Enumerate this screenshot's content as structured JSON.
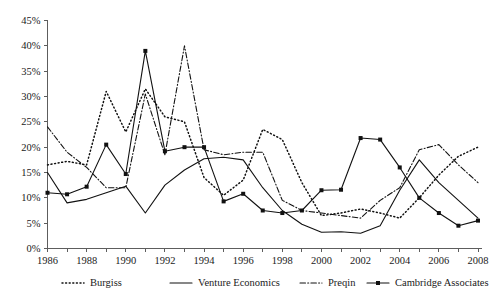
{
  "figure": {
    "title": "",
    "background_color": "#ffffff",
    "line_color": "#111111",
    "axis_color": "#5d5d5d"
  },
  "axes": {
    "y_ticks": [
      "0%",
      "5%",
      "10%",
      "15%",
      "20%",
      "25%",
      "30%",
      "35%",
      "40%",
      "45%"
    ],
    "x_ticks": [
      "1986",
      "1988",
      "1990",
      "1992",
      "1994",
      "1996",
      "1998",
      "2000",
      "2002",
      "2004",
      "2006",
      "2008"
    ]
  },
  "legend": {
    "position": "bottom",
    "items": [
      {
        "label": "Burgiss",
        "style": "dotted",
        "marker": "none"
      },
      {
        "label": "Venture Economics",
        "style": "solid",
        "marker": "none"
      },
      {
        "label": "Preqin",
        "style": "dash-dot",
        "marker": "none"
      },
      {
        "label": "Cambridge Associates",
        "style": "solid",
        "marker": "square"
      }
    ]
  },
  "chart_data": {
    "type": "line",
    "title": "",
    "xlabel": "",
    "ylabel": "",
    "xlim": [
      1986,
      2008
    ],
    "ylim": [
      0,
      45
    ],
    "y_unit": "percent",
    "grid": false,
    "legend_position": "bottom",
    "x": [
      1986,
      1987,
      1988,
      1989,
      1990,
      1991,
      1992,
      1993,
      1994,
      1995,
      1996,
      1997,
      1998,
      1999,
      2000,
      2001,
      2002,
      2003,
      2004,
      2005,
      2006,
      2007,
      2008
    ],
    "x_tick_labels": [
      "1986",
      "",
      "1988",
      "",
      "1990",
      "",
      "1992",
      "",
      "1994",
      "",
      "1996",
      "",
      "1998",
      "",
      "2000",
      "",
      "2002",
      "",
      "2004",
      "",
      "2006",
      "",
      "2008"
    ],
    "series": [
      {
        "name": "Burgiss",
        "style": "dotted",
        "marker": "none",
        "values": [
          16.5,
          17.2,
          16.5,
          31.0,
          23.0,
          31.5,
          26.0,
          25.0,
          14.0,
          10.5,
          13.5,
          23.5,
          21.5,
          13.0,
          6.5,
          7.0,
          7.8,
          7.0,
          6.0,
          10.0,
          14.5,
          18.2,
          20.0
        ]
      },
      {
        "name": "Venture Economics",
        "style": "solid",
        "marker": "none",
        "values": [
          15.0,
          9.0,
          9.7,
          11.0,
          12.3,
          7.0,
          12.5,
          15.5,
          17.7,
          18.0,
          17.5,
          12.0,
          7.5,
          4.8,
          3.2,
          3.3,
          3.0,
          4.5,
          11.5,
          17.5,
          13.0,
          9.5,
          6.0
        ]
      },
      {
        "name": "Preqin",
        "style": "dash-dot",
        "marker": "none",
        "values": [
          24.0,
          19.0,
          16.0,
          12.0,
          12.0,
          30.5,
          18.5,
          40.0,
          19.5,
          18.5,
          19.0,
          19.0,
          9.5,
          7.5,
          7.0,
          6.5,
          6.0,
          9.5,
          12.0,
          19.5,
          20.5,
          16.5,
          13.0
        ]
      },
      {
        "name": "Cambridge Associates",
        "style": "solid",
        "marker": "square",
        "values": [
          11.0,
          10.7,
          12.2,
          20.5,
          14.7,
          39.0,
          19.2,
          20.0,
          20.0,
          9.3,
          10.8,
          7.5,
          7.0,
          7.5,
          11.5,
          11.6,
          21.8,
          21.5,
          16.0,
          10.0,
          7.0,
          4.5,
          5.5
        ]
      }
    ],
    "series_points": [
      {
        "name": "Burgiss",
        "points": [
          {
            "x": 1986,
            "y": 16.5
          },
          {
            "x": 1987,
            "y": 17.2
          },
          {
            "x": 1988,
            "y": 16.5
          },
          {
            "x": 1989,
            "y": 14.0
          },
          {
            "x": 1990,
            "y": 19.0
          },
          {
            "x": 1991,
            "y": 31.2
          },
          {
            "x": 1992,
            "y": 30.0
          },
          {
            "x": 1993,
            "y": 25.0
          },
          {
            "x": 1994,
            "y": 11.5
          },
          {
            "x": 1995,
            "y": 12.0
          },
          {
            "x": 1996,
            "y": 15.0
          },
          {
            "x": 1997,
            "y": 24.5
          },
          {
            "x": 1998,
            "y": 18.5
          },
          {
            "x": 1999,
            "y": 11.5
          },
          {
            "x": 2000,
            "y": 8.3
          },
          {
            "x": 2001,
            "y": 6.5
          },
          {
            "x": 2002,
            "y": 6.7
          },
          {
            "x": 2003,
            "y": 8.4
          },
          {
            "x": 2004,
            "y": 9.0
          },
          {
            "x": 2005,
            "y": 11.0
          },
          {
            "x": 2006,
            "y": 13.5
          },
          {
            "x": 2007,
            "y": 16.5
          },
          {
            "x": 2008,
            "y": 18.5
          }
        ]
      }
    ],
    "annotations": [
      {
        "text": "Peak 1991 ≈ 40%",
        "x": 1991,
        "y": 40
      },
      {
        "text": "Secondary peak 2002 ≈ 22%",
        "x": 2002,
        "y": 22
      },
      {
        "text": "Cambridge Associates ends at 0% in 2008",
        "x": 2008,
        "y": 0
      }
    ]
  }
}
